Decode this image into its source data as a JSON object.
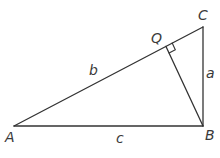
{
  "diagram": {
    "type": "geometry",
    "vertices": {
      "A": {
        "label": "A",
        "x": 14,
        "y": 126
      },
      "B": {
        "label": "B",
        "x": 203,
        "y": 126
      },
      "C": {
        "label": "C",
        "x": 203,
        "y": 27
      },
      "Q": {
        "label": "Q",
        "x": 166,
        "y": 46
      }
    },
    "sides": {
      "a": {
        "label": "a",
        "from": "B",
        "to": "C"
      },
      "b": {
        "label": "b",
        "from": "A",
        "to": "C"
      },
      "c": {
        "label": "c",
        "from": "A",
        "to": "B"
      }
    },
    "segments": [
      {
        "from": "A",
        "to": "B"
      },
      {
        "from": "B",
        "to": "C"
      },
      {
        "from": "A",
        "to": "C"
      },
      {
        "from": "B",
        "to": "Q"
      }
    ],
    "right_angle_marker": {
      "at": "Q"
    },
    "stroke_color": "#333333"
  }
}
